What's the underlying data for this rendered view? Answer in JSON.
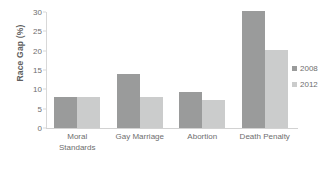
{
  "chart_data": {
    "type": "bar",
    "title": "",
    "xlabel": "",
    "ylabel": "Race Gap (%)",
    "ylim": [
      0,
      30
    ],
    "yticks": [
      0,
      5,
      10,
      15,
      20,
      25,
      30
    ],
    "ytick_labels": [
      "0",
      "5",
      "10",
      "15",
      "20",
      "25",
      "30"
    ],
    "grid": false,
    "legend_position": "right",
    "categories": [
      "Moral\nStandards",
      "Gay Marriage",
      "Abortion",
      "Death Penalty"
    ],
    "series": [
      {
        "name": "2008",
        "color": "#9a9b9b",
        "values": [
          8.0,
          14.0,
          9.2,
          30.3
        ]
      },
      {
        "name": "2012",
        "color": "#cbcccc",
        "values": [
          8.0,
          8.1,
          7.2,
          20.3
        ]
      }
    ]
  },
  "legend": {
    "items": [
      {
        "label": "2008"
      },
      {
        "label": "2012"
      }
    ]
  },
  "colors": {
    "series_2008": "#9a9b9b",
    "series_2012": "#cbcccc",
    "axis": "#d8d8d8",
    "text": "#6e6e6e",
    "background": "#ffffff"
  }
}
